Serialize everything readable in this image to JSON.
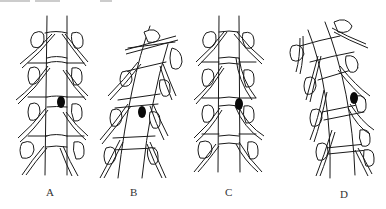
{
  "figure": {
    "panels": [
      {
        "id": "A",
        "label": "A",
        "curvature": "straight",
        "lesion": {
          "x": 61,
          "y": 102
        }
      },
      {
        "id": "B",
        "label": "B",
        "curvature": "tilted-right",
        "lesion": {
          "x": 142,
          "y": 112
        }
      },
      {
        "id": "C",
        "label": "C",
        "curvature": "straight",
        "lesion": {
          "x": 239,
          "y": 104
        }
      },
      {
        "id": "D",
        "label": "D",
        "curvature": "curved-left",
        "lesion": {
          "x": 354,
          "y": 98
        }
      }
    ],
    "colors": {
      "line": "#1a1a1a",
      "lesion": "#0a0a0a",
      "background": "#ffffff"
    }
  }
}
